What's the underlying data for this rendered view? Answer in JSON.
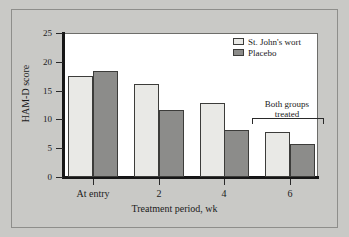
{
  "chart_data": {
    "type": "bar",
    "title": "",
    "xlabel": "Treatment period, wk",
    "ylabel": "HAM-D score",
    "categories": [
      "At entry",
      "2",
      "4",
      "6"
    ],
    "ylim": [
      0,
      25
    ],
    "yticks": [
      0,
      5,
      10,
      15,
      20,
      25
    ],
    "grid": false,
    "legend_position": "top-right",
    "series": [
      {
        "name": "St. John's wort",
        "color": "#e9e9e6",
        "values": [
          17.6,
          16.2,
          12.9,
          7.8
        ]
      },
      {
        "name": "Placebo",
        "color": "#8c8c8a",
        "values": [
          18.4,
          11.6,
          8.2,
          5.8
        ]
      }
    ],
    "annotations": [
      {
        "text_line1": "Both groups",
        "text_line2": "treated",
        "target_category": "6"
      }
    ]
  },
  "figure": {
    "background_color": "#c9c9c6",
    "plot_background_color": "#ffffff",
    "frame_color": "#8e8e8b"
  }
}
